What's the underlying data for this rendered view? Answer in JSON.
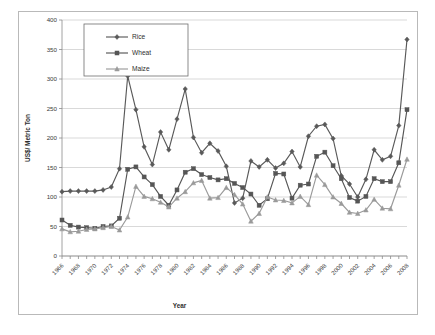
{
  "figure": {
    "frame_color": "#b9b9b9",
    "background": "#ffffff"
  },
  "axis_titles": {
    "x": "Year",
    "y": "US$/ Metric Ton"
  },
  "legend": {
    "position": "top-left-inside",
    "entries": [
      {
        "label": "Rice",
        "color": "#595959",
        "marker": "diamond"
      },
      {
        "label": "Wheat",
        "color": "#565656",
        "marker": "square"
      },
      {
        "label": "Maize",
        "color": "#9a9a9a",
        "marker": "triangle"
      }
    ]
  },
  "chart_data": {
    "type": "line",
    "title": "",
    "subtitle": "",
    "xlabel": "Year",
    "ylabel": "US$/ Metric Ton",
    "xlim": [
      1966,
      2008
    ],
    "ylim": [
      0,
      400
    ],
    "ytick_step": 50,
    "yticks": [
      0,
      50,
      100,
      150,
      200,
      250,
      300,
      350,
      400
    ],
    "xticks": [
      1966,
      1968,
      1970,
      1972,
      1974,
      1976,
      1978,
      1980,
      1982,
      1984,
      1986,
      1988,
      1990,
      1992,
      1994,
      1996,
      1998,
      2000,
      2002,
      2004,
      2006,
      2008
    ],
    "xtick_labels": [
      "1966",
      "1968",
      "1970",
      "1972",
      "1974",
      "1976",
      "1978",
      "1980",
      "1982",
      "1984",
      "1986",
      "1988",
      "1990",
      "1992",
      "1994",
      "1996",
      "1998",
      "2000",
      "2002",
      "2004",
      "2006",
      "2008"
    ],
    "xtick_rotation": -45,
    "grid": "horizontal",
    "legend_entries": [
      "Rice",
      "Wheat",
      "Maize"
    ],
    "x": [
      1966,
      1967,
      1968,
      1969,
      1970,
      1971,
      1972,
      1973,
      1974,
      1975,
      1976,
      1977,
      1978,
      1979,
      1980,
      1981,
      1982,
      1983,
      1984,
      1985,
      1986,
      1987,
      1988,
      1989,
      1990,
      1991,
      1992,
      1993,
      1994,
      1995,
      1996,
      1997,
      1998,
      1999,
      2000,
      2001,
      2002,
      2003,
      2004,
      2005,
      2006,
      2007,
      2008
    ],
    "series": [
      {
        "name": "Rice",
        "color": "#595959",
        "marker": "diamond",
        "values": [
          109,
          110,
          110,
          110,
          110,
          112,
          117,
          148,
          305,
          248,
          185,
          155,
          210,
          180,
          232,
          283,
          201,
          175,
          191,
          178,
          152,
          90,
          98,
          161,
          151,
          163,
          149,
          157,
          177,
          151,
          203,
          220,
          223,
          199,
          136,
          122,
          100,
          130,
          180,
          163,
          169,
          221,
          367
        ]
      },
      {
        "name": "Wheat",
        "color": "#565656",
        "marker": "square",
        "values": [
          61,
          52,
          49,
          48,
          47,
          50,
          51,
          64,
          147,
          151,
          134,
          121,
          101,
          86,
          112,
          142,
          148,
          138,
          133,
          129,
          131,
          123,
          116,
          105,
          86,
          97,
          140,
          139,
          98,
          120,
          122,
          169,
          176,
          153,
          131,
          99,
          93,
          101,
          131,
          126,
          126,
          158,
          248
        ]
      },
      {
        "name": "Maize",
        "color": "#9a9a9a",
        "marker": "triangle",
        "values": [
          46,
          41,
          42,
          45,
          46,
          48,
          50,
          44,
          66,
          118,
          101,
          97,
          91,
          83,
          98,
          109,
          124,
          128,
          98,
          99,
          116,
          104,
          88,
          59,
          72,
          100,
          95,
          94,
          90,
          101,
          87,
          137,
          121,
          100,
          89,
          74,
          72,
          78,
          96,
          81,
          80,
          120,
          164
        ]
      }
    ]
  }
}
